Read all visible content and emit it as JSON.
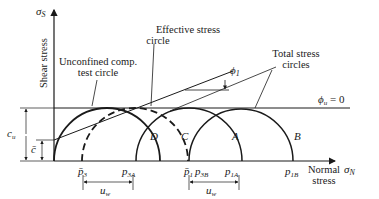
{
  "axes": {
    "y_symbol": "σ",
    "y_symbol_sub": "S",
    "y_label": "Shear stress",
    "x_symbol": "σ",
    "x_symbol_sub": "N",
    "x_label_line1": "Normal",
    "x_label_line2": "stress"
  },
  "annotations": {
    "effective_line1": "Effective stress",
    "effective_line2": "circle",
    "unconfined_line1": "Unconfined comp.",
    "unconfined_line2": "test circle",
    "total_line1": "Total stress",
    "total_line2": "circles",
    "phi1": "ϕ",
    "phi1_sub": "1",
    "phiu": "ϕ",
    "phiu_sub": "u",
    "phiu_eq": " = 0",
    "cu": "c",
    "cu_sub": "u",
    "cbar": "c̄"
  },
  "circle_labels": {
    "D": "D",
    "C": "C",
    "A": "A",
    "B": "B"
  },
  "ticks": {
    "p3": "p̄",
    "p3_sub": "3",
    "p3A": "p",
    "p3A_sub": "3A",
    "p1": "p̄",
    "p1_sub": "1",
    "p3B": "p",
    "p3B_sub": "3B",
    "p1A": "p",
    "p1A_sub": "1A",
    "p1B": "p",
    "p1B_sub": "1B",
    "uw": "u",
    "uw_sub": "w"
  }
}
